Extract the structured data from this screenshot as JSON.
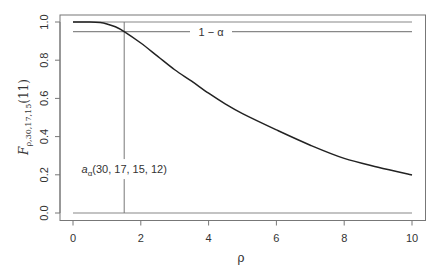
{
  "chart_data": {
    "type": "line",
    "title": "",
    "xlabel": "ρ",
    "ylabel": {
      "base": "F",
      "subscript": "ρ,30,17,15",
      "suffix": "(11)"
    },
    "xlim": [
      0,
      10
    ],
    "ylim": [
      0,
      1
    ],
    "grid": false,
    "x_ticks": [
      0,
      2,
      4,
      6,
      8,
      10
    ],
    "x_tick_labels": [
      "0",
      "2",
      "4",
      "6",
      "8",
      "10"
    ],
    "y_ticks": [
      0,
      0.2,
      0.4,
      0.6,
      0.8,
      1.0
    ],
    "y_tick_labels": [
      "0.0",
      "0.2",
      "0.4",
      "0.6",
      "0.8",
      "1.0"
    ],
    "series": [
      {
        "name": "F_ρ,30,17,15(11)",
        "color": "#222222",
        "x": [
          0,
          0.5,
          0.8,
          1.0,
          1.25,
          1.51,
          2.0,
          2.5,
          3.0,
          3.5,
          4.0,
          4.5,
          5.0,
          6.0,
          7.0,
          8.0,
          9.0,
          10.0
        ],
        "y": [
          1.0,
          1.0,
          0.997,
          0.99,
          0.975,
          0.95,
          0.89,
          0.82,
          0.75,
          0.69,
          0.627,
          0.57,
          0.52,
          0.435,
          0.355,
          0.286,
          0.24,
          0.199
        ]
      }
    ],
    "reference_lines": [
      {
        "name": "upper-bound-line",
        "orientation": "horizontal",
        "value": 1.0,
        "color": "#888888"
      },
      {
        "name": "one-minus-alpha-line",
        "orientation": "horizontal",
        "value": 0.95,
        "color": "#888888",
        "label": "1 − α"
      },
      {
        "name": "zero-line",
        "orientation": "horizontal",
        "value": 0.0,
        "color": "#888888"
      },
      {
        "name": "a-alpha-line",
        "orientation": "vertical",
        "value": 1.51,
        "color": "#777777"
      }
    ],
    "annotations": [
      {
        "name": "a-alpha-label",
        "base": "a",
        "subscript": "α",
        "suffix": "(30, 17, 15, 12)",
        "x": 1.51,
        "y": 0.23
      }
    ]
  }
}
